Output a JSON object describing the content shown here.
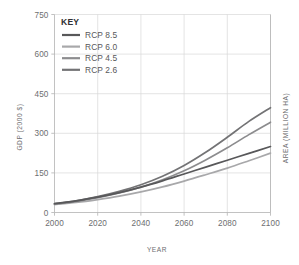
{
  "chart_data": {
    "type": "line",
    "title": "",
    "xlabel": "YEAR",
    "ylabel": "GDP (2000 $)",
    "y2label": "AREA (MILLION HA)",
    "xlim": [
      2000,
      2100
    ],
    "ylim": [
      0,
      750
    ],
    "grid": true,
    "legend_position": "top-left",
    "legend_title": "KEY",
    "x": [
      2000,
      2010,
      2020,
      2030,
      2040,
      2050,
      2060,
      2070,
      2080,
      2090,
      2100
    ],
    "xticks": [
      "2000",
      "2020",
      "2040",
      "2060",
      "2080",
      "2100"
    ],
    "xtick_values": [
      2000,
      2020,
      2040,
      2060,
      2080,
      2100
    ],
    "yticks": [
      "0",
      "150",
      "300",
      "450",
      "600",
      "750"
    ],
    "ytick_values": [
      0,
      150,
      300,
      450,
      600,
      750
    ],
    "series": [
      {
        "name": "RCP 8.5",
        "color": "#58585a",
        "values": [
          34,
          44,
          58,
          75,
          96,
          120,
          146,
          172,
          198,
          224,
          250
        ]
      },
      {
        "name": "RCP 6.0",
        "color": "#a8a8aa",
        "values": [
          30,
          38,
          49,
          62,
          78,
          97,
          119,
          143,
          168,
          196,
          225
        ]
      },
      {
        "name": "RCP 4.5",
        "color": "#8c8c8e",
        "values": [
          32,
          42,
          56,
          74,
          96,
          124,
          158,
          199,
          245,
          295,
          342
        ]
      },
      {
        "name": "RCP 2.6",
        "color": "#737375",
        "values": [
          33,
          44,
          60,
          80,
          105,
          137,
          178,
          228,
          285,
          345,
          397
        ]
      }
    ]
  },
  "axes": {
    "x_title": "YEAR",
    "y_left_title": "GDP (2000 $)",
    "y_right_title": "AREA (MILLION HA)"
  },
  "legend": {
    "title": "KEY",
    "items": [
      {
        "label": "RCP 8.5",
        "color": "#58585a"
      },
      {
        "label": "RCP 6.0",
        "color": "#a8a8aa"
      },
      {
        "label": "RCP 4.5",
        "color": "#8c8c8e"
      },
      {
        "label": "RCP 2.6",
        "color": "#737375"
      }
    ]
  }
}
